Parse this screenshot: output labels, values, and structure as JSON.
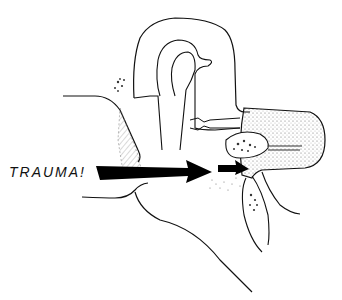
{
  "diagram": {
    "label": "TRAUMA!",
    "label_position": {
      "x": 9,
      "y": 173
    },
    "ink_color": "#111111",
    "stipple_color": "#555555",
    "background": "#ffffff",
    "elements": [
      {
        "name": "trauma-label",
        "text": "TRAUMA!"
      },
      {
        "name": "large-arrow",
        "direction": "right",
        "from": [
          96,
          172
        ],
        "to": [
          212,
          172
        ]
      },
      {
        "name": "small-arrow",
        "direction": "right",
        "from": [
          218,
          169
        ],
        "to": [
          248,
          169
        ]
      },
      {
        "name": "ear-canal",
        "type": "outline"
      },
      {
        "name": "eardrum",
        "type": "hatched membrane"
      },
      {
        "name": "ossicle-chain",
        "type": "outline"
      },
      {
        "name": "semicircular-canal",
        "type": "outline"
      },
      {
        "name": "cochlea-region",
        "type": "stippled"
      },
      {
        "name": "vestibule-bone",
        "type": "stippled"
      }
    ]
  }
}
